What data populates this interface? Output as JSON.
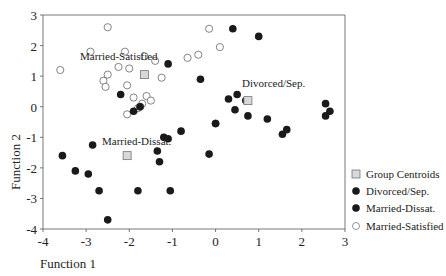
{
  "chart_data": {
    "type": "scatter",
    "title": "",
    "xlabel": "Function 1",
    "ylabel": "Function 2",
    "xlim": [
      -4,
      3
    ],
    "ylim": [
      -4,
      3
    ],
    "xticks": [
      -4,
      -3,
      -2,
      -1,
      0,
      1,
      2,
      3
    ],
    "yticks": [
      -4,
      -3,
      -2,
      -1,
      0,
      1,
      2,
      3
    ],
    "xtick_labels": [
      "-4",
      "-3",
      "-2",
      "-1",
      "0",
      "1",
      "2",
      "3"
    ],
    "ytick_labels": [
      "-4",
      "-3",
      "-2",
      "-1",
      "0",
      "1",
      "2",
      "3"
    ],
    "grid": false,
    "legend_position": "lower right, outside plot",
    "legend": [
      {
        "label": "Group Centroids",
        "marker": "square-gray"
      },
      {
        "label": "Divorced/Sep.",
        "marker": "filled-circle"
      },
      {
        "label": "Married-Dissat.",
        "marker": "filled-circle"
      },
      {
        "label": "Married-Satisfied",
        "marker": "open-circle"
      }
    ],
    "annotations": [
      {
        "text": "Married-Satisfied",
        "x": -2.3,
        "y": 1.4
      },
      {
        "text": "Divorced/Sep.",
        "x": 0.6,
        "y": 0.6
      },
      {
        "text": "Married-Dissat.",
        "x": -2.3,
        "y": -1.3
      }
    ],
    "series": [
      {
        "name": "Group Centroids",
        "marker": "square",
        "points": [
          {
            "x": -1.65,
            "y": 1.05
          },
          {
            "x": 0.75,
            "y": 0.2
          },
          {
            "x": -2.05,
            "y": -1.6
          }
        ]
      },
      {
        "name": "Married-Satisfied",
        "marker": "open-circle",
        "points": [
          {
            "x": -3.6,
            "y": 1.2
          },
          {
            "x": -2.5,
            "y": 2.6
          },
          {
            "x": -2.9,
            "y": 1.8
          },
          {
            "x": -2.1,
            "y": 1.8
          },
          {
            "x": -1.65,
            "y": 1.65
          },
          {
            "x": -1.4,
            "y": 1.5
          },
          {
            "x": -2.25,
            "y": 1.3
          },
          {
            "x": -2.0,
            "y": 1.25
          },
          {
            "x": -2.5,
            "y": 1.05
          },
          {
            "x": -2.6,
            "y": 0.85
          },
          {
            "x": -2.55,
            "y": 0.65
          },
          {
            "x": -2.05,
            "y": 0.7
          },
          {
            "x": -1.9,
            "y": 0.3
          },
          {
            "x": -1.7,
            "y": 0.1
          },
          {
            "x": -1.25,
            "y": 0.95
          },
          {
            "x": -1.6,
            "y": 0.35
          },
          {
            "x": -1.5,
            "y": 0.2
          },
          {
            "x": -2.05,
            "y": -0.25
          },
          {
            "x": -1.8,
            "y": -0.05
          },
          {
            "x": -0.65,
            "y": 1.6
          },
          {
            "x": -0.4,
            "y": 1.7
          },
          {
            "x": -0.15,
            "y": 2.55
          },
          {
            "x": 0.1,
            "y": 1.95
          },
          {
            "x": 0.0,
            "y": -0.55
          },
          {
            "x": -1.75,
            "y": 0.0
          }
        ]
      },
      {
        "name": "Divorced/Sep.",
        "marker": "filled-circle",
        "points": [
          {
            "x": 0.4,
            "y": 2.55
          },
          {
            "x": 1.0,
            "y": 2.3
          },
          {
            "x": -1.1,
            "y": 1.4
          },
          {
            "x": -0.35,
            "y": 0.9
          },
          {
            "x": 0.3,
            "y": 0.25
          },
          {
            "x": 0.5,
            "y": 0.4
          },
          {
            "x": 0.7,
            "y": 0.2
          },
          {
            "x": 0.45,
            "y": -0.1
          },
          {
            "x": 0.75,
            "y": -0.3
          },
          {
            "x": 0.0,
            "y": -0.55
          },
          {
            "x": 1.2,
            "y": -0.4
          },
          {
            "x": 1.65,
            "y": -0.75
          },
          {
            "x": 1.55,
            "y": -0.9
          },
          {
            "x": 2.55,
            "y": 0.1
          },
          {
            "x": 2.65,
            "y": -0.15
          },
          {
            "x": 2.55,
            "y": -0.3
          },
          {
            "x": -0.15,
            "y": -1.55
          },
          {
            "x": -0.8,
            "y": -0.8
          }
        ]
      },
      {
        "name": "Married-Dissat.",
        "marker": "filled-circle",
        "points": [
          {
            "x": -2.2,
            "y": 0.4
          },
          {
            "x": -1.9,
            "y": -0.15
          },
          {
            "x": -1.75,
            "y": 0.0
          },
          {
            "x": -1.2,
            "y": -1.0
          },
          {
            "x": -1.1,
            "y": -1.05
          },
          {
            "x": -1.35,
            "y": -1.45
          },
          {
            "x": -1.3,
            "y": -1.8
          },
          {
            "x": -1.05,
            "y": -2.75
          },
          {
            "x": -1.8,
            "y": -2.75
          },
          {
            "x": -2.85,
            "y": -1.25
          },
          {
            "x": -3.55,
            "y": -1.6
          },
          {
            "x": -3.25,
            "y": -2.1
          },
          {
            "x": -2.95,
            "y": -2.2
          },
          {
            "x": -2.7,
            "y": -2.75
          },
          {
            "x": -2.5,
            "y": -3.7
          }
        ]
      }
    ]
  },
  "axes": {
    "x_title": "Function 1",
    "y_title": "Function 2"
  },
  "labels": {
    "married_satisfied": "Married-Satisfied",
    "divorced_sep": "Divorced/Sep.",
    "married_dissat": "Married-Dissat."
  },
  "legend": {
    "items": [
      {
        "label": "Group Centroids"
      },
      {
        "label": "Divorced/Sep."
      },
      {
        "label": "Married-Dissat."
      },
      {
        "label": "Married-Satisfied"
      }
    ]
  },
  "colors": {
    "filled_marker": "#1a1a1a",
    "open_marker_stroke": "#666666",
    "centroid_fill": "#d8d8d8",
    "centroid_stroke": "#777777",
    "axis": "#555555"
  }
}
